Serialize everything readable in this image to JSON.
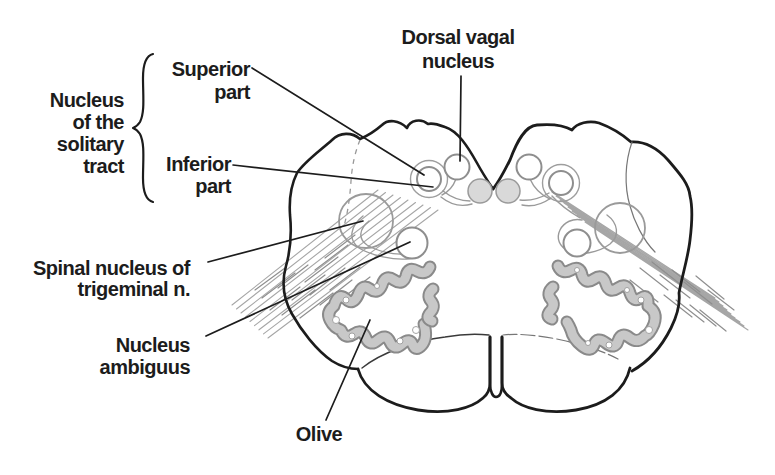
{
  "labels": {
    "dorsal_vagal_nucleus": {
      "lines": [
        "Dorsal vagal",
        "nucleus"
      ]
    },
    "nucleus_of_the_solitary_tract": {
      "lines": [
        "Nucleus",
        "of the",
        "solitary",
        "tract"
      ]
    },
    "superior_part": {
      "lines": [
        "Superior",
        "part"
      ]
    },
    "inferior_part": {
      "lines": [
        "Inferior",
        "part"
      ]
    },
    "spinal_nucleus_of_trigeminal": {
      "lines": [
        "Spinal nucleus of",
        "trigeminal n."
      ]
    },
    "nucleus_ambiguus": {
      "lines": [
        "Nucleus",
        "ambiguus"
      ]
    },
    "olive": {
      "lines": [
        "Olive"
      ]
    }
  },
  "colors": {
    "ink": "#1c1c1c",
    "background": "#ffffff",
    "nucleus_outline": "#8e8e8e",
    "nucleus_fill": "#ffffff",
    "gray_nucleus_fill": "#d9d9d9",
    "olive_outline": "#8a8a8a",
    "olive_fill": "#c8c8c8",
    "fiber": "#a6a6a6"
  }
}
